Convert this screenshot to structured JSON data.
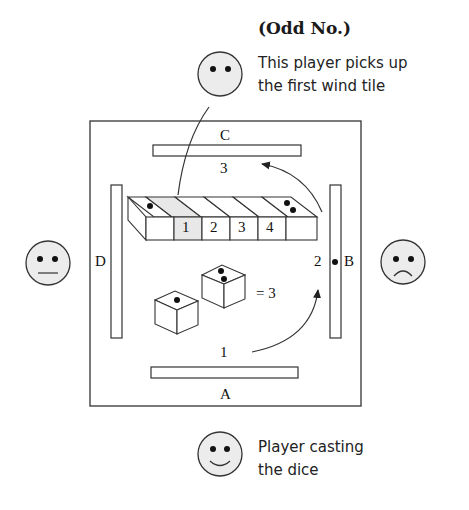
{
  "title": "(Odd No.)",
  "annotations": {
    "top_player_note_line1": "This player picks up",
    "top_player_note_line2": "the first wind tile",
    "bottom_player_note_line1": "Player casting",
    "bottom_player_note_line2": "the dice"
  },
  "seats": {
    "north": "C",
    "east": "B",
    "south": "A",
    "west": "D"
  },
  "count_labels": {
    "south": "1",
    "east": "2",
    "north": "3"
  },
  "dice": {
    "die1": 1,
    "die2": 2,
    "result_label": "= 3"
  },
  "tiles": {
    "numbers": [
      "1",
      "2",
      "3",
      "4"
    ],
    "highlight_color": "#e8e8e8"
  },
  "faces": {
    "north": "neutral-dots",
    "west": "flat-mouth",
    "east": "frown",
    "south": "smile"
  }
}
